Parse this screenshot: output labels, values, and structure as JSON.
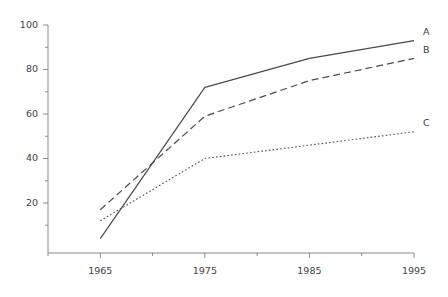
{
  "chart_data": {
    "type": "line",
    "title": "",
    "subtitle": "",
    "xlabel": "",
    "ylabel": "",
    "x": [
      1965,
      1975,
      1985,
      1995
    ],
    "categories": [
      "1965",
      "1975",
      "1985",
      "1995"
    ],
    "series": [
      {
        "name": "A",
        "label": "A",
        "style": "solid",
        "color": "#4a4a4a",
        "values": [
          4,
          72,
          85,
          93
        ]
      },
      {
        "name": "B",
        "label": "B",
        "style": "dashed",
        "color": "#4a4a4a",
        "values": [
          17,
          59,
          75,
          85
        ]
      },
      {
        "name": "C",
        "label": "C",
        "style": "dotted",
        "color": "#4a4a4a",
        "values": [
          12,
          40,
          46,
          52
        ]
      }
    ],
    "xlim": [
      1960,
      1995
    ],
    "ylim": [
      0,
      100
    ],
    "yticks": [
      20,
      40,
      60,
      80,
      100
    ],
    "ytick_labels": [
      "20",
      "40",
      "60",
      "80",
      "100"
    ],
    "y_minor_ticks": [
      10,
      30,
      50,
      70,
      90
    ],
    "xticks": [
      1965,
      1975,
      1985,
      1995
    ],
    "xtick_labels": [
      "1965",
      "1975",
      "1985",
      "1995"
    ],
    "x_minor_ticks": [
      1960,
      1970,
      1980,
      1990
    ],
    "grid": false,
    "legend_position": "right-inline",
    "axis_color": "#8a8a8a",
    "text_color": "#404040"
  }
}
